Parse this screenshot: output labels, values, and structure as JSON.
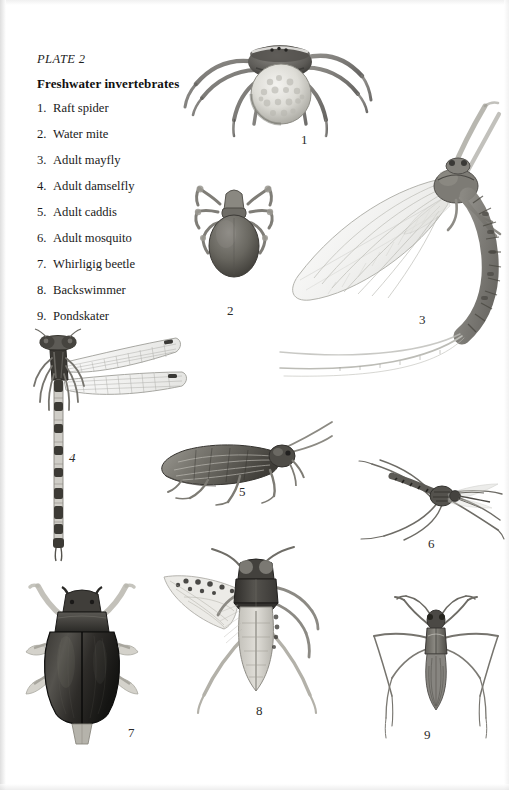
{
  "plate": {
    "label": "PLATE 2",
    "title": "Freshwater invertebrates"
  },
  "legend": {
    "items": [
      {
        "num": "1.",
        "name": "Raft spider"
      },
      {
        "num": "2.",
        "name": "Water mite"
      },
      {
        "num": "3.",
        "name": "Adult mayfly"
      },
      {
        "num": "4.",
        "name": "Adult damselfly"
      },
      {
        "num": "5.",
        "name": "Adult caddis"
      },
      {
        "num": "6.",
        "name": "Adult mosquito"
      },
      {
        "num": "7.",
        "name": "Whirligig beetle"
      },
      {
        "num": "8.",
        "name": "Backswimmer"
      },
      {
        "num": "9.",
        "name": "Pondskater"
      }
    ]
  },
  "figure_numbers": {
    "f1": "1",
    "f2": "2",
    "f3": "3",
    "f4": "4",
    "f5": "5",
    "f6": "6",
    "f7": "7",
    "f8": "8",
    "f9": "9"
  },
  "figures": [
    {
      "id": "raft-spider",
      "num": "1",
      "subject": "Raft spider with egg sac"
    },
    {
      "id": "water-mite",
      "num": "2",
      "subject": "Water mite"
    },
    {
      "id": "adult-mayfly",
      "num": "3",
      "subject": "Adult mayfly"
    },
    {
      "id": "adult-damselfly",
      "num": "4",
      "subject": "Adult damselfly"
    },
    {
      "id": "adult-caddis",
      "num": "5",
      "subject": "Adult caddis"
    },
    {
      "id": "adult-mosquito",
      "num": "6",
      "subject": "Adult mosquito"
    },
    {
      "id": "whirligig-beetle",
      "num": "7",
      "subject": "Whirligig beetle"
    },
    {
      "id": "backswimmer",
      "num": "8",
      "subject": "Backswimmer"
    },
    {
      "id": "pondskater",
      "num": "9",
      "subject": "Pondskater"
    }
  ],
  "colors": {
    "page_background": "#ffffff",
    "text": "#1a1a1a",
    "ink_dark": "#3a3a3a",
    "ink_mid": "#6f6f6f",
    "ink_light": "#a8a8a8",
    "ink_faint": "#cccccc"
  }
}
